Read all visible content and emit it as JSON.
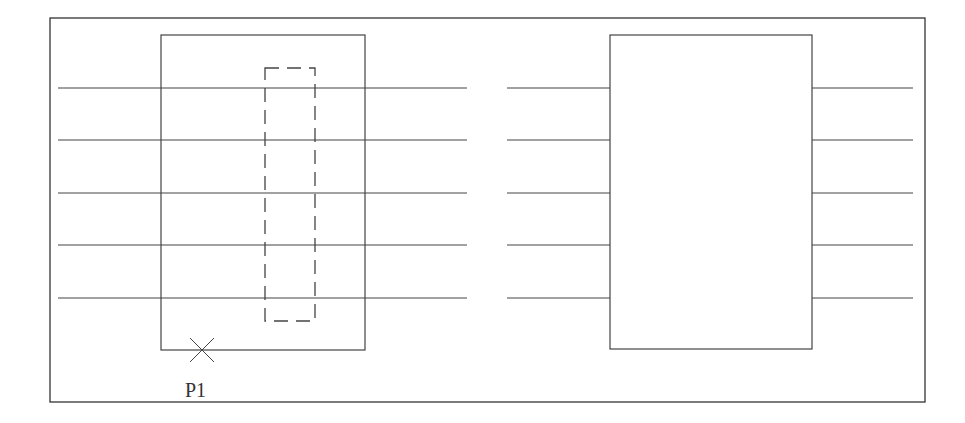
{
  "diagram": {
    "colors": {
      "stroke": "#444444",
      "frame": "#333333",
      "background": "#ffffff"
    },
    "frame": {
      "x": 50,
      "y": 18,
      "w": 875,
      "h": 384
    },
    "left_figure": {
      "rect": {
        "x": 161,
        "y": 35,
        "w": 204,
        "h": 315
      },
      "lines": {
        "x1": 58,
        "x2": 467,
        "ys": [
          88,
          140,
          193,
          245,
          298
        ]
      },
      "selection_window": {
        "x": 265,
        "y": 68,
        "w": 50,
        "h": 253,
        "style": "dashed"
      },
      "pick_point": {
        "x": 202,
        "y": 350,
        "marker": "cross",
        "label": "P1"
      }
    },
    "right_figure": {
      "rect": {
        "x": 610,
        "y": 35,
        "w": 202,
        "h": 314
      },
      "lines_left": {
        "x1": 507,
        "x2": 610,
        "ys": [
          88,
          140,
          193,
          245,
          298
        ]
      },
      "lines_right": {
        "x1": 812,
        "x2": 913,
        "ys": [
          88,
          140,
          193,
          245,
          298
        ]
      }
    }
  }
}
